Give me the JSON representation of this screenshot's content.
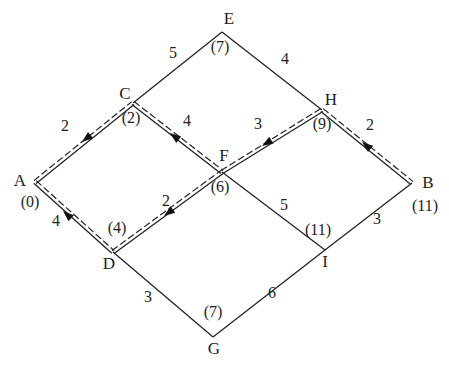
{
  "figure": {
    "background": "#ffffff",
    "ink": "#232323",
    "nodes": [
      {
        "id": "A",
        "x": 35,
        "y": 182,
        "label": "A",
        "label_x": 20,
        "label_y": 182,
        "distance": "(0)",
        "distance_x": 30,
        "distance_y": 203
      },
      {
        "id": "B",
        "x": 412,
        "y": 183,
        "label": "B",
        "label_x": 428,
        "label_y": 184,
        "distance": "(11)",
        "distance_x": 425,
        "distance_y": 207
      },
      {
        "id": "C",
        "x": 133,
        "y": 103,
        "label": "C",
        "label_x": 125,
        "label_y": 95,
        "distance": "(2)",
        "distance_x": 131,
        "distance_y": 119
      },
      {
        "id": "D",
        "x": 113,
        "y": 252,
        "label": "D",
        "label_x": 109,
        "label_y": 265,
        "distance": "(4)",
        "distance_x": 117,
        "distance_y": 229
      },
      {
        "id": "E",
        "x": 222,
        "y": 32,
        "label": "E",
        "label_x": 229,
        "label_y": 20,
        "distance": "(7)",
        "distance_x": 220,
        "distance_y": 48
      },
      {
        "id": "F",
        "x": 222,
        "y": 172,
        "label": "F",
        "label_x": 224,
        "label_y": 157,
        "distance": "(6)",
        "distance_x": 220,
        "distance_y": 188
      },
      {
        "id": "G",
        "x": 213,
        "y": 337,
        "label": "G",
        "label_x": 214,
        "label_y": 350,
        "distance": "(7)",
        "distance_x": 213,
        "distance_y": 313
      },
      {
        "id": "H",
        "x": 322,
        "y": 110,
        "label": "H",
        "label_x": 331,
        "label_y": 101,
        "distance": "(9)",
        "distance_x": 322,
        "distance_y": 125
      },
      {
        "id": "I",
        "x": 325,
        "y": 250,
        "label": "I",
        "label_x": 325,
        "label_y": 263,
        "distance": "(11)",
        "distance_x": 318,
        "distance_y": 231
      }
    ],
    "edges": [
      {
        "from": "A",
        "to": "C",
        "weight": "2",
        "weight_x": 65,
        "weight_y": 127,
        "on_shortest_path": true,
        "arrow_points_to": "A",
        "arrow_tip_x": 82,
        "arrow_tip_y": 142
      },
      {
        "from": "C",
        "to": "E",
        "weight": "5",
        "weight_x": 173,
        "weight_y": 54,
        "on_shortest_path": false
      },
      {
        "from": "E",
        "to": "H",
        "weight": "4",
        "weight_x": 285,
        "weight_y": 60,
        "on_shortest_path": false
      },
      {
        "from": "H",
        "to": "B",
        "weight": "2",
        "weight_x": 370,
        "weight_y": 126,
        "on_shortest_path": true,
        "arrow_points_to": "H",
        "arrow_tip_x": 362,
        "arrow_tip_y": 142
      },
      {
        "from": "C",
        "to": "F",
        "weight": "4",
        "weight_x": 187,
        "weight_y": 122,
        "on_shortest_path": true,
        "arrow_points_to": "C",
        "arrow_tip_x": 170,
        "arrow_tip_y": 133
      },
      {
        "from": "F",
        "to": "H",
        "weight": "3",
        "weight_x": 258,
        "weight_y": 125,
        "on_shortest_path": true,
        "arrow_points_to": "F",
        "arrow_tip_x": 262,
        "arrow_tip_y": 146
      },
      {
        "from": "A",
        "to": "D",
        "weight": "4",
        "weight_x": 56,
        "weight_y": 222,
        "on_shortest_path": true,
        "arrow_points_to": "A",
        "arrow_tip_x": 63,
        "arrow_tip_y": 211
      },
      {
        "from": "D",
        "to": "F",
        "weight": "2",
        "weight_x": 166,
        "weight_y": 202,
        "on_shortest_path": true,
        "arrow_points_to": "D",
        "arrow_tip_x": 164,
        "arrow_tip_y": 216
      },
      {
        "from": "F",
        "to": "I",
        "weight": "5",
        "weight_x": 284,
        "weight_y": 206,
        "on_shortest_path": false
      },
      {
        "from": "I",
        "to": "B",
        "weight": "3",
        "weight_x": 377,
        "weight_y": 220,
        "on_shortest_path": false
      },
      {
        "from": "D",
        "to": "G",
        "weight": "3",
        "weight_x": 148,
        "weight_y": 298,
        "on_shortest_path": false
      },
      {
        "from": "G",
        "to": "I",
        "weight": "6",
        "weight_x": 272,
        "weight_y": 294,
        "on_shortest_path": false
      }
    ]
  }
}
